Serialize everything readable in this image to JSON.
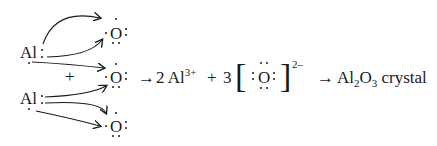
{
  "reactants": {
    "aluminum_atoms": [
      {
        "symbol": "Al",
        "valence_dots": ":"
      },
      {
        "symbol": "Al",
        "valence_dots": ":"
      }
    ],
    "plus": "+",
    "oxygen_atoms": [
      {
        "symbol": "O"
      },
      {
        "symbol": "O"
      },
      {
        "symbol": "O"
      }
    ]
  },
  "products": {
    "arrow1": "→",
    "cation_coefficient": "2",
    "cation_symbol": "Al",
    "cation_charge": "3+",
    "plus": "+",
    "anion_coefficient": "3",
    "anion_symbol": "O",
    "anion_charge": "2–",
    "arrow2": "→",
    "final_formula_al": "Al",
    "final_sub_al": "2",
    "final_formula_o": "O",
    "final_sub_o": "3",
    "final_label": "crystal"
  }
}
